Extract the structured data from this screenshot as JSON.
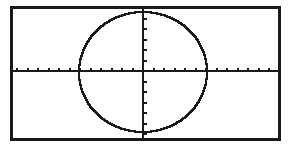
{
  "screen": {
    "label": "graphing-calculator-display",
    "background_color": "#ffffff",
    "ink_color": "#1a1a1a",
    "frame": {
      "label": "screen-border",
      "x": 10,
      "y": 6,
      "width": 271,
      "height": 135,
      "stroke_width": 3,
      "color": "#1a1a1a"
    }
  },
  "axes": {
    "x_axis": {
      "label": "x-axis",
      "y_position": 71,
      "x_start": 13,
      "x_end": 279,
      "stroke_width": 2,
      "tick_spacing": 10.5,
      "tick_length": 4,
      "tick_count": 25
    },
    "y_axis": {
      "label": "y-axis",
      "x_position": 143,
      "y_start": 9,
      "y_end": 139,
      "stroke_width": 2,
      "tick_spacing": 10.5,
      "tick_length": 4,
      "tick_count": 12
    },
    "origin": {
      "x": 143,
      "y": 71
    }
  },
  "chart_data": {
    "type": "line",
    "title": "",
    "xlabel": "",
    "ylabel": "",
    "plot_kind": "circle",
    "grid": false,
    "legend": null,
    "xlim": [
      -12.4,
      12.9
    ],
    "ylim": [
      -6.4,
      6.2
    ],
    "xtick_step": 1,
    "ytick_step": 1,
    "series": [
      {
        "name": "circle",
        "equation": "x^2 + y^2 = r^2",
        "center": [
          0,
          0
        ],
        "radius": 6,
        "center_px": [
          143,
          72
        ],
        "radius_x_px": 64,
        "radius_y_px": 60,
        "stroke_width": 2,
        "color": "#1a1a1a",
        "render_style": "pixelated-stepped"
      }
    ]
  }
}
